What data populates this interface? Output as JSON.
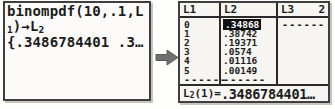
{
  "home_screen": {
    "line1": "binompdf(10,.1,L",
    "line2": {
      "sub1": "1",
      "mid": ")→L",
      "sub2": "2"
    },
    "line3": "{.3486784401 .3…"
  },
  "transition_arrow": {
    "direction": "right"
  },
  "list_editor": {
    "headers": {
      "col1": "L1",
      "col2": "L2",
      "col3": "L3",
      "cursor_column": "2"
    },
    "l1_values": [
      "0",
      "1",
      "2",
      "3",
      "4",
      "5"
    ],
    "l2_values": [
      ".34868",
      ".38742",
      ".19371",
      ".0574",
      ".01116",
      ".00149"
    ],
    "l2_selected_index": 0,
    "empty_dashes": "------",
    "status": {
      "list": "L",
      "list_sub": "2",
      "index_eq": "(1)=",
      "value": ".3486784401…"
    }
  },
  "colors": {
    "text": "#1c1c1c",
    "border": "#3f3f3f",
    "highlight_bg": "#101010",
    "highlight_text": "#ffffff",
    "arrow": "#6f6f6f",
    "background": "#fefefd"
  }
}
